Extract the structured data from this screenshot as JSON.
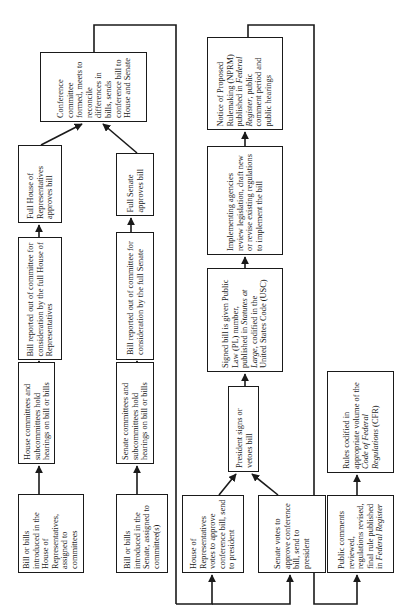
{
  "diagram": {
    "orientation": "rotated-90-ccw",
    "line_color": "#1a1a1a",
    "background": "#ffffff",
    "nodes": [
      {
        "id": "house-intro",
        "text": "Bill or bills introduced in the House of Representatives, assigned to committees",
        "box": [
          18,
          494,
          66,
          79
        ],
        "tw": 70
      },
      {
        "id": "house-hearings",
        "text": "House committees and subcommittees hold hearings on bill or bills",
        "box": [
          18,
          362,
          37,
          102
        ],
        "tw": 94
      },
      {
        "id": "house-reported",
        "text": "Bill reported out of committee for consideration by the full House of Representatives",
        "box": [
          18,
          237,
          44,
          123
        ],
        "tw": 115
      },
      {
        "id": "house-approves",
        "text": "Full House of Representatives approves bill",
        "box": [
          18,
          145,
          44,
          78
        ],
        "tw": 70
      },
      {
        "id": "senate-intro",
        "text": "Bill or bills introduced in the Senate, assigned to committee(s)",
        "box": [
          116,
          494,
          52,
          79
        ],
        "tw": 70
      },
      {
        "id": "senate-hearings",
        "text": "Senate committees and subcommittees hold hearings on bill or bills",
        "box": [
          116,
          362,
          38,
          102
        ],
        "tw": 94
      },
      {
        "id": "senate-reported",
        "text": "Bill reported out of committee for consideration by the full Senate",
        "box": [
          116,
          232,
          38,
          128
        ],
        "tw": 118
      },
      {
        "id": "senate-approves",
        "text": "Full Senate approves bill",
        "box": [
          116,
          153,
          38,
          63
        ],
        "tw": 55
      },
      {
        "id": "conference",
        "text": "Conference committee formed, meets to reconcile differences in bills, sends conference bill to House and Senate",
        "box": [
          40,
          52,
          107,
          70
        ],
        "tw": 62
      },
      {
        "id": "house-votes",
        "text": "House of Representatives votes to approve conference bill, send to president",
        "box": [
          182,
          495,
          62,
          78
        ],
        "tw": 70
      },
      {
        "id": "senate-votes",
        "text": "Senate votes to approve conference bill, send to president",
        "box": [
          258,
          495,
          68,
          78
        ],
        "tw": 70
      },
      {
        "id": "president",
        "text": "President signs or vetoes bill",
        "box": [
          228,
          386,
          31,
          86
        ],
        "tw": 78
      },
      {
        "id": "signed-bill",
        "text_parts": [
          "Signed bill is given Public Law (PL) number, published in ",
          "Statutes at Large",
          ", codified in the United States Code (USC)"
        ],
        "italic_index": 1,
        "box": [
          207,
          268,
          76,
          104
        ],
        "tw": 96
      },
      {
        "id": "implementing",
        "text": "Implementing agencies review legislation, draft new or revise existing regulations to implement the bill",
        "box": [
          207,
          146,
          76,
          109
        ],
        "tw": 100
      },
      {
        "id": "nprm",
        "text_parts": [
          "Notice of Proposed Rulemaking (NPRM) published in ",
          "Federal Register",
          ", public comment period and public hearings"
        ],
        "italic_index": 1,
        "box": [
          207,
          37,
          76,
          93
        ],
        "tw": 85
      },
      {
        "id": "public-comments",
        "text_parts": [
          "Public comments reviewed, regulations revised, final rule published in ",
          "Federal Register"
        ],
        "italic_index": 1,
        "box": [
          327,
          495,
          67,
          78
        ],
        "tw": 70
      },
      {
        "id": "rules-codified",
        "text_parts": [
          "Rules codified in appropriate volume of the ",
          "Code of Federal Regulations",
          " (CFR)"
        ],
        "italic_index": 1,
        "box": [
          327,
          371,
          67,
          102
        ],
        "tw": 94
      }
    ],
    "edges": [
      {
        "from": "house-intro",
        "to": "house-hearings"
      },
      {
        "from": "house-hearings",
        "to": "house-reported"
      },
      {
        "from": "house-reported",
        "to": "house-approves"
      },
      {
        "from": "house-approves",
        "to": "conference"
      },
      {
        "from": "senate-intro",
        "to": "senate-hearings"
      },
      {
        "from": "senate-hearings",
        "to": "senate-reported"
      },
      {
        "from": "senate-reported",
        "to": "senate-approves"
      },
      {
        "from": "senate-approves",
        "to": "conference"
      },
      {
        "from": "conference",
        "to": "house-votes"
      },
      {
        "from": "conference",
        "to": "senate-votes"
      },
      {
        "from": "house-votes",
        "to": "president"
      },
      {
        "from": "senate-votes",
        "to": "president"
      },
      {
        "from": "president",
        "to": "signed-bill"
      },
      {
        "from": "signed-bill",
        "to": "implementing"
      },
      {
        "from": "implementing",
        "to": "nprm"
      },
      {
        "from": "nprm",
        "to": "public-comments"
      },
      {
        "from": "public-comments",
        "to": "rules-codified"
      }
    ]
  }
}
